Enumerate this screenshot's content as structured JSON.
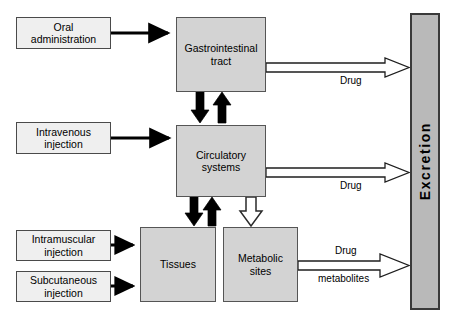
{
  "diagram": {
    "colors": {
      "source_box_fill": "#efefef",
      "organ_box_fill": "#d3d3d3",
      "excretion_fill": "#b9b9b9",
      "box_stroke": "#555555",
      "solid_arrow": "#000000",
      "hollow_arrow_fill": "#ffffff"
    }
  },
  "sources": [
    {
      "id": "oral",
      "line1": "Oral",
      "line2": "administration"
    },
    {
      "id": "intravenous",
      "line1": "Intravenous",
      "line2": "injection"
    },
    {
      "id": "intramuscular",
      "line1": "Intramuscular",
      "line2": "injection"
    },
    {
      "id": "subcutaneous",
      "line1": "Subcutaneous",
      "line2": "injection"
    }
  ],
  "compartments": [
    {
      "id": "gi",
      "line1": "Gastrointestinal",
      "line2": "tract"
    },
    {
      "id": "circulatory",
      "line1": "Circulatory",
      "line2": "systems"
    },
    {
      "id": "tissues",
      "line1": "Tissues",
      "line2": ""
    },
    {
      "id": "metabolic",
      "line1": "Metabolic",
      "line2": "sites"
    }
  ],
  "excretion": {
    "label": "Excretion"
  },
  "edge_labels": [
    {
      "id": "gi-drug",
      "text": "Drug"
    },
    {
      "id": "circ-drug",
      "text": "Drug"
    },
    {
      "id": "metab-drug",
      "text": "Drug"
    },
    {
      "id": "metab-metabolites",
      "text": "metabolites"
    }
  ]
}
